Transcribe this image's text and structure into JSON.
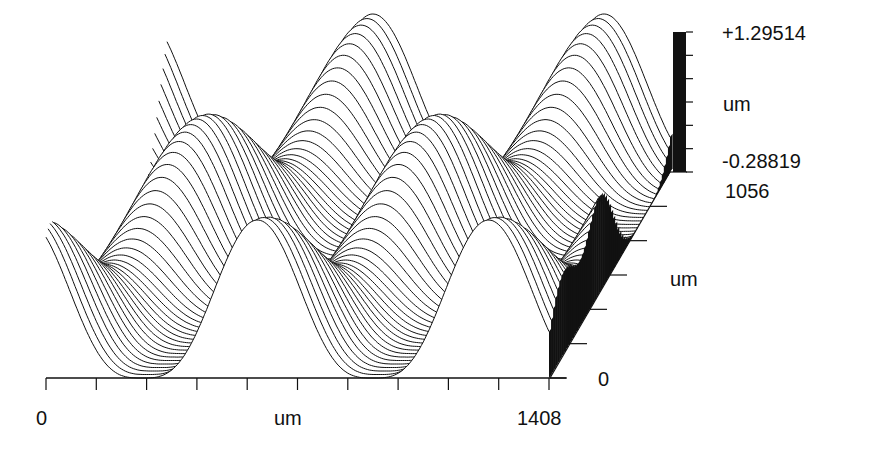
{
  "chart_data": {
    "type": "surface-waterfall",
    "title": "",
    "x_axis": {
      "label": "um",
      "min": 0,
      "max": 1408,
      "min_label": "0",
      "max_label": "1408",
      "tick_count": 11
    },
    "y_axis": {
      "label": "um",
      "min": 0,
      "max": 1056,
      "min_label": "0",
      "max_label": "1056",
      "tick_count": 7
    },
    "z_axis": {
      "label": "um",
      "min": -0.28819,
      "max": 1.29514,
      "min_label": "-0.28819",
      "max_label": "+1.29514",
      "tick_count": 7
    },
    "surface": {
      "function": "z = A*(0.5+0.5*cos(2*pi*x/px))*(0.5+0.5*cos(2*pi*y/py)) skewed lattice",
      "x_period_um": 647,
      "y_period_um": 528,
      "profile_lines": 60,
      "samples_per_line": 260
    },
    "grid": false,
    "legend": "height color bar (right)"
  },
  "labels": {
    "z_max": "+1.29514",
    "z_unit": "um",
    "z_min": "-0.28819",
    "y_max": "1056",
    "y_unit": "um",
    "y_min": "0",
    "x_min": "0",
    "x_unit": "um",
    "x_max": "1408"
  },
  "colors": {
    "line": "#111111",
    "fill": "#ffffff",
    "bar": "#111111"
  }
}
